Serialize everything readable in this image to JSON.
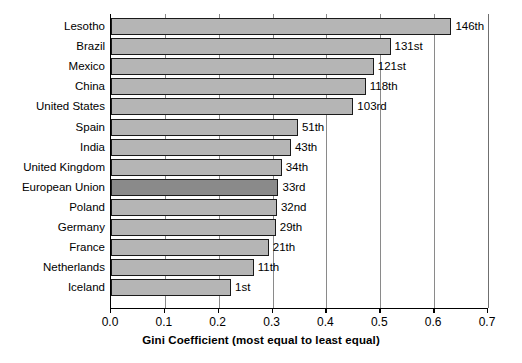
{
  "chart_data": {
    "type": "bar",
    "orientation": "horizontal",
    "title": "",
    "xlabel": "Gini Coefficient (most equal to least equal)",
    "ylabel": "",
    "xlim": [
      0.0,
      0.7
    ],
    "xticks": [
      "0.0",
      "0.1",
      "0.2",
      "0.3",
      "0.4",
      "0.5",
      "0.6",
      "0.7"
    ],
    "xtick_values": [
      0.0,
      0.1,
      0.2,
      0.3,
      0.4,
      0.5,
      0.6,
      0.7
    ],
    "grid": "vertical",
    "legend": "none",
    "bar_color": "#b5b5b5",
    "highlight_color": "#8a8a8a",
    "highlight_category": "European Union",
    "categories": [
      "Lesotho",
      "Brazil",
      "Mexico",
      "China",
      "United States",
      "Spain",
      "India",
      "United Kingdom",
      "European Union",
      "Poland",
      "Germany",
      "France",
      "Netherlands",
      "Iceland"
    ],
    "values": [
      0.632,
      0.519,
      0.488,
      0.473,
      0.45,
      0.347,
      0.334,
      0.317,
      0.311,
      0.308,
      0.306,
      0.293,
      0.265,
      0.223
    ],
    "data_labels": [
      "146th",
      "131st",
      "121st",
      "118th",
      "103rd",
      "51th",
      "43th",
      "34th",
      "33rd",
      "32nd",
      "29th",
      "21th",
      "11th",
      "1st"
    ]
  }
}
